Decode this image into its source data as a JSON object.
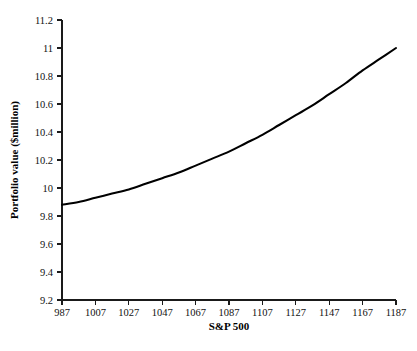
{
  "chart_data": {
    "type": "line",
    "title": "",
    "xlabel": "S&P 500",
    "ylabel": "Portfolio value ($million)",
    "xlim": [
      987,
      1187
    ],
    "ylim": [
      9.2,
      11.2
    ],
    "grid": false,
    "legend": null,
    "x_ticks": [
      987,
      1007,
      1027,
      1047,
      1067,
      1087,
      1107,
      1127,
      1147,
      1167,
      1187
    ],
    "y_ticks": [
      9.2,
      9.4,
      9.6,
      9.8,
      10,
      10.2,
      10.4,
      10.6,
      10.8,
      11,
      11.2
    ],
    "x_tick_labels": [
      "987",
      "1007",
      "1027",
      "1047",
      "1067",
      "1087",
      "1107",
      "1127",
      "1147",
      "1167",
      "1187"
    ],
    "y_tick_labels": [
      "9.2",
      "9.4",
      "9.6",
      "9.8",
      "10",
      "10.2",
      "10.4",
      "10.6",
      "10.8",
      "11",
      "11.2"
    ],
    "series": [
      {
        "name": "Portfolio value",
        "color": "#000000",
        "x": [
          987,
          997,
          1007,
          1017,
          1027,
          1037,
          1047,
          1057,
          1067,
          1077,
          1087,
          1097,
          1107,
          1117,
          1127,
          1137,
          1147,
          1157,
          1167,
          1177,
          1187
        ],
        "values": [
          9.88,
          9.9,
          9.93,
          9.96,
          9.99,
          10.03,
          10.07,
          10.11,
          10.16,
          10.21,
          10.26,
          10.32,
          10.38,
          10.45,
          10.52,
          10.59,
          10.67,
          10.75,
          10.84,
          10.92,
          11.0
        ]
      }
    ]
  },
  "labels": {
    "x_axis_title": "S&P 500",
    "y_axis_title": "Portfolio value ($million)"
  }
}
